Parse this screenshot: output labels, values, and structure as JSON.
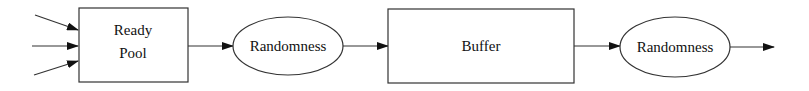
{
  "diagram": {
    "title": "",
    "nodes": [
      {
        "id": "ready_pool",
        "shape": "rectangle",
        "lines": [
          "Ready",
          "Pool"
        ]
      },
      {
        "id": "randomness_1",
        "shape": "ellipse",
        "label": "Randomness"
      },
      {
        "id": "buffer",
        "shape": "rectangle",
        "label": "Buffer"
      },
      {
        "id": "randomness_2",
        "shape": "ellipse",
        "label": "Randomness"
      }
    ],
    "edges": [
      {
        "from": "input_1",
        "to": "ready_pool"
      },
      {
        "from": "input_2",
        "to": "ready_pool"
      },
      {
        "from": "input_3",
        "to": "ready_pool"
      },
      {
        "from": "ready_pool",
        "to": "randomness_1"
      },
      {
        "from": "randomness_1",
        "to": "buffer"
      },
      {
        "from": "buffer",
        "to": "randomness_2"
      },
      {
        "from": "randomness_2",
        "to": "output"
      }
    ],
    "colors": {
      "stroke": "#333333",
      "background": "#ffffff",
      "text": "#111111"
    }
  }
}
